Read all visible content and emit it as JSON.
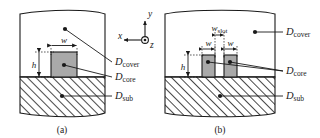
{
  "figure": {
    "panels": [
      {
        "id": "a",
        "caption": "(a)",
        "description": "Single ridge core on substrate with cover",
        "regions": [
          {
            "name": "cover",
            "label": "D",
            "subscript": "cover"
          },
          {
            "name": "core",
            "label": "D",
            "subscript": "core"
          },
          {
            "name": "substrate",
            "label": "D",
            "subscript": "sub"
          }
        ],
        "dimensions": [
          {
            "name": "width",
            "label": "w",
            "subscript": ""
          },
          {
            "name": "height",
            "label": "h",
            "subscript": ""
          }
        ]
      },
      {
        "id": "b",
        "caption": "(b)",
        "description": "Slot waveguide: two ridge cores separated by a slot",
        "regions": [
          {
            "name": "cover",
            "label": "D",
            "subscript": "cover"
          },
          {
            "name": "core",
            "label": "D",
            "subscript": "core"
          },
          {
            "name": "substrate",
            "label": "D",
            "subscript": "sub"
          }
        ],
        "dimensions": [
          {
            "name": "slot-width",
            "label": "w",
            "subscript": "slot"
          },
          {
            "name": "width-left",
            "label": "w",
            "subscript": ""
          },
          {
            "name": "width-right",
            "label": "w",
            "subscript": ""
          },
          {
            "name": "height",
            "label": "h",
            "subscript": ""
          }
        ]
      }
    ],
    "axes": {
      "name": "coordinate-axes",
      "x": "x",
      "y": "y",
      "z": "z",
      "z_direction": "out-of-page"
    },
    "colors": {
      "stroke": "#1a1a1a",
      "core_fill": "#a9a9a9",
      "cover_fill": "#ffffff",
      "substrate_fill": "#ffffff",
      "hatch": "#1a1a1a",
      "background": "#ffffff"
    }
  }
}
